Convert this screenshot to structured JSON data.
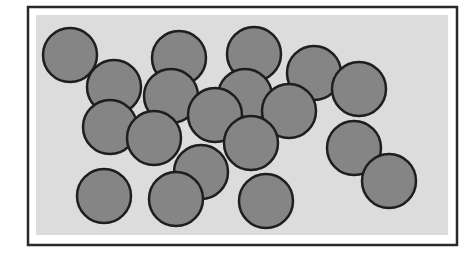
{
  "figure": {
    "frame": {
      "x": 28,
      "y": 7,
      "width": 429,
      "height": 238,
      "stroke": "#2a2a2a",
      "stroke_width": 2.5
    },
    "inner_area": {
      "x": 36,
      "y": 15,
      "width": 412,
      "height": 220,
      "fill": "#dcdcdc"
    },
    "circle_style": {
      "radius": 27,
      "fill": "#858585",
      "stroke": "#1e1e1e",
      "stroke_width": 2.5
    },
    "circles": [
      {
        "cx": 70,
        "cy": 55
      },
      {
        "cx": 179,
        "cy": 58
      },
      {
        "cx": 254,
        "cy": 54
      },
      {
        "cx": 114,
        "cy": 87
      },
      {
        "cx": 171,
        "cy": 96
      },
      {
        "cx": 245,
        "cy": 96
      },
      {
        "cx": 314,
        "cy": 73
      },
      {
        "cx": 359,
        "cy": 89
      },
      {
        "cx": 289,
        "cy": 111
      },
      {
        "cx": 110,
        "cy": 127
      },
      {
        "cx": 215,
        "cy": 115
      },
      {
        "cx": 154,
        "cy": 138
      },
      {
        "cx": 201,
        "cy": 172
      },
      {
        "cx": 251,
        "cy": 143
      },
      {
        "cx": 354,
        "cy": 148
      },
      {
        "cx": 389,
        "cy": 181
      },
      {
        "cx": 104,
        "cy": 196
      },
      {
        "cx": 176,
        "cy": 199
      },
      {
        "cx": 266,
        "cy": 201
      }
    ],
    "circle_count": 19
  }
}
